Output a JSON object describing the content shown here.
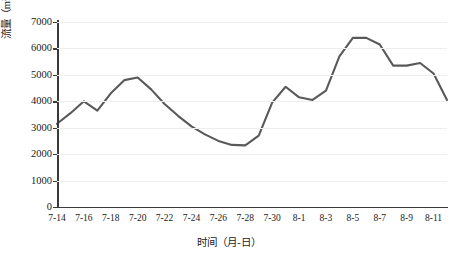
{
  "chart_data": {
    "type": "line",
    "title": "",
    "xlabel": "时间（月-日）",
    "ylabel": "流量（m³/s）",
    "ylim": [
      0,
      7000
    ],
    "ytick_values": [
      0,
      1000,
      2000,
      3000,
      4000,
      5000,
      6000,
      7000
    ],
    "ytick_labels": [
      "0",
      "1000",
      "2000",
      "3000",
      "4000",
      "5000",
      "6000",
      "7000"
    ],
    "grid": true,
    "legend": "none",
    "x": [
      "7-14",
      "7-15",
      "7-16",
      "7-17",
      "7-18",
      "7-19",
      "7-20",
      "7-21",
      "7-22",
      "7-23",
      "7-24",
      "7-25",
      "7-26",
      "7-27",
      "7-28",
      "7-29",
      "7-30",
      "7-31",
      "8-1",
      "8-2",
      "8-3",
      "8-4",
      "8-5",
      "8-6",
      "8-7",
      "8-8",
      "8-9",
      "8-10",
      "8-11",
      "8-12"
    ],
    "xtick_labels": [
      "7-14",
      "7-16",
      "7-18",
      "7-20",
      "7-22",
      "7-24",
      "7-26",
      "7-28",
      "7-30",
      "8-1",
      "8-3",
      "8-5",
      "8-7",
      "8-9",
      "8-11"
    ],
    "series": [
      {
        "name": "流量",
        "color": "#595959",
        "values": [
          3150,
          3550,
          4000,
          3650,
          4300,
          4800,
          4900,
          4450,
          3900,
          3450,
          3050,
          2750,
          2500,
          2350,
          2330,
          2700,
          3950,
          4550,
          4150,
          4050,
          4400,
          5700,
          6400,
          6400,
          6150,
          5350,
          5350,
          5450,
          5050,
          4050
        ]
      }
    ]
  },
  "axes": {
    "y_title": "流量（m",
    "y_title_sup": "3",
    "y_title_tail": "/s）",
    "x_title": "时间（月-日）"
  }
}
